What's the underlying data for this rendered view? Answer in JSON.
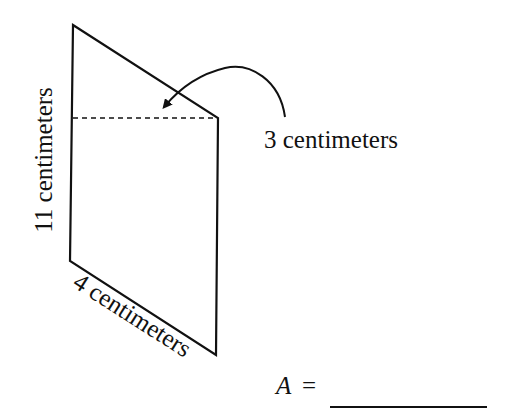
{
  "figure": {
    "shape": "trapezoid",
    "labels": {
      "height": "11 centimeters",
      "base": "4 centimeters",
      "short_side_diff": "3 centimeters"
    },
    "answer": {
      "variable": "A",
      "equals": "=",
      "blank": ""
    },
    "colors": {
      "stroke": "#111111",
      "background": "#ffffff"
    }
  }
}
